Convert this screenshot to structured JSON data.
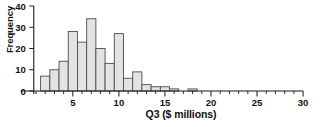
{
  "chart_data": {
    "type": "bar",
    "title": "",
    "subtitle": "",
    "xlabel": "Q3 ($ millions)",
    "ylabel": "Frequency",
    "xlim": [
      0,
      30
    ],
    "ylim": [
      0,
      40
    ],
    "grid": false,
    "legend": null,
    "bin_width": 1,
    "bin_start": 1.5,
    "x_major_ticks": [
      5,
      10,
      15,
      20,
      25,
      30
    ],
    "x_major_tick_labels": [
      "5",
      "10",
      "15",
      "20",
      "25",
      "30"
    ],
    "x_minor_tick_step": 1,
    "y_ticks": [
      0,
      10,
      20,
      30,
      40
    ],
    "y_tick_labels": [
      "0",
      "10",
      "20",
      "30",
      "40"
    ],
    "bin_edges": [
      1.5,
      2.5,
      3.5,
      4.5,
      5.5,
      6.5,
      7.5,
      8.5,
      9.5,
      10.5,
      11.5,
      12.5,
      13.5,
      14.5,
      15.5,
      16.5,
      17.5,
      18.5
    ],
    "categories": [
      "1.5-2.5",
      "2.5-3.5",
      "3.5-4.5",
      "4.5-5.5",
      "5.5-6.5",
      "6.5-7.5",
      "7.5-8.5",
      "8.5-9.5",
      "9.5-10.5",
      "10.5-11.5",
      "11.5-12.5",
      "12.5-13.5",
      "13.5-14.5",
      "14.5-15.5",
      "15.5-16.5",
      "16.5-17.5",
      "17.5-18.5"
    ],
    "values": [
      7,
      10,
      14,
      28,
      23,
      34,
      20,
      13,
      27,
      6,
      9,
      3,
      2,
      2,
      1,
      0,
      1
    ],
    "bar_fill_color": "#e3e3e3",
    "bar_edge_color": "#4d4d4d",
    "axis_color": "#1a1a1a"
  }
}
